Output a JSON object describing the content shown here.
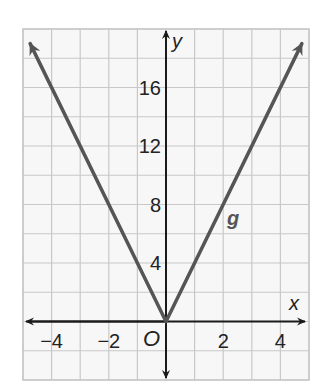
{
  "chart_data": {
    "type": "line",
    "title": "",
    "xlabel": "x",
    "ylabel": "y",
    "origin_label": "O",
    "xlim": [
      -5,
      5
    ],
    "ylim": [
      -4,
      20
    ],
    "grid": true,
    "x_grid_step": 1,
    "y_grid_step": 2,
    "x_ticks": [
      -4,
      -2,
      2,
      4
    ],
    "x_tick_labels": [
      "−4",
      "−2",
      "2",
      "4"
    ],
    "y_ticks": [
      4,
      8,
      12,
      16
    ],
    "y_tick_labels": [
      "4",
      "8",
      "12",
      "16"
    ],
    "series": [
      {
        "name": "g",
        "equation": "g(x) = 4|x|",
        "x": [
          -4.75,
          0,
          4.75
        ],
        "values": [
          19,
          0,
          19
        ],
        "color": "#555555",
        "arrows_at_ends": true
      }
    ],
    "annotations": [
      {
        "text": "g",
        "x": 1.9,
        "y": 8
      }
    ]
  },
  "colors": {
    "grid": "#c8c8c8",
    "axis": "#1a1a1a",
    "line": "#555555",
    "background": "#f7f7f7"
  }
}
